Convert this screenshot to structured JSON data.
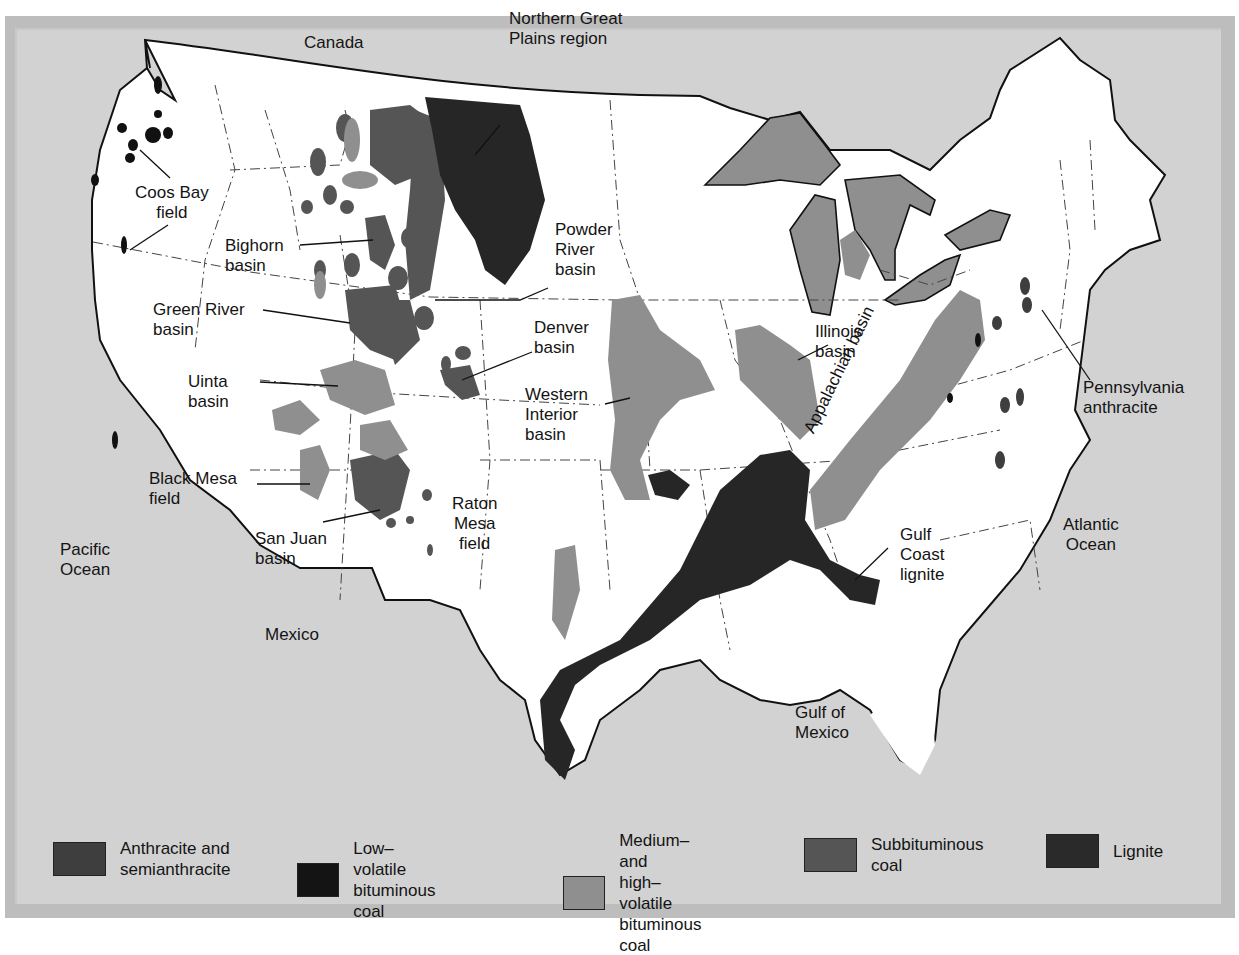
{
  "figure": {
    "caption_fragment": "(…) … ing… … …y …"
  },
  "colors": {
    "frame": "#bdbdbd",
    "ocean": "#d2d2d2",
    "land": "#ffffff",
    "anthracite": "#3e3e3e",
    "low_volatile": "#141414",
    "medium_high_volatile": "#8f8f8f",
    "subbituminous": "#555555",
    "lignite": "#2a2a2a",
    "lakes": "#8f8f8f"
  },
  "geography": {
    "canada": "Canada",
    "mexico": "Mexico",
    "pacific": "Pacific\nOcean",
    "atlantic": "Atlantic\nOcean",
    "gulf": "Gulf of\nMexico"
  },
  "regions": [
    {
      "id": "northern-great-plains",
      "label": "Northern Great\nPlains region"
    },
    {
      "id": "coos-bay",
      "label": "Coos Bay\nfield"
    },
    {
      "id": "bighorn",
      "label": "Bighorn\nbasin"
    },
    {
      "id": "powder-river",
      "label": "Powder\nRiver\nbasin"
    },
    {
      "id": "green-river",
      "label": "Green River\nbasin"
    },
    {
      "id": "denver",
      "label": "Denver\nbasin"
    },
    {
      "id": "uinta",
      "label": "Uinta\nbasin"
    },
    {
      "id": "western-interior",
      "label": "Western\nInterior\nbasin"
    },
    {
      "id": "illinois",
      "label": "Illinois\nbasin"
    },
    {
      "id": "appalachian",
      "label": "Appalachian basin"
    },
    {
      "id": "pennsylvania-anthracite",
      "label": "Pennsylvania\nanthracite"
    },
    {
      "id": "black-mesa",
      "label": "Black Mesa\nfield"
    },
    {
      "id": "san-juan",
      "label": "San Juan\nbasin"
    },
    {
      "id": "raton-mesa",
      "label": "Raton\nMesa\nfield"
    },
    {
      "id": "gulf-coast-lignite",
      "label": "Gulf\nCoast\nlignite"
    }
  ],
  "legend": [
    {
      "label": "Anthracite and\nsemianthracite",
      "color": "#3e3e3e"
    },
    {
      "label": "Low–volatile\nbituminous coal",
      "color": "#141414"
    },
    {
      "label": "Medium–and\nhigh–volatile\nbituminous coal",
      "color": "#8f8f8f"
    },
    {
      "label": "Subbituminous\ncoal",
      "color": "#555555"
    },
    {
      "label": "Lignite",
      "color": "#2a2a2a"
    }
  ]
}
